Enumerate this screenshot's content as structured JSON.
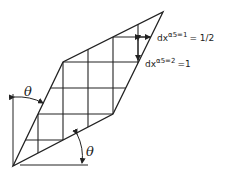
{
  "diagram": {
    "angle_label_left": "θ",
    "angle_label_bottom": "θ",
    "dim1": {
      "prefix": "dx",
      "superscript": "α5=1",
      "suffix": "= 1/2"
    },
    "dim2": {
      "prefix": "dx",
      "superscript": "α5=2",
      "suffix": "=1"
    }
  },
  "colors": {
    "stroke": "#222222",
    "background": "#ffffff"
  }
}
